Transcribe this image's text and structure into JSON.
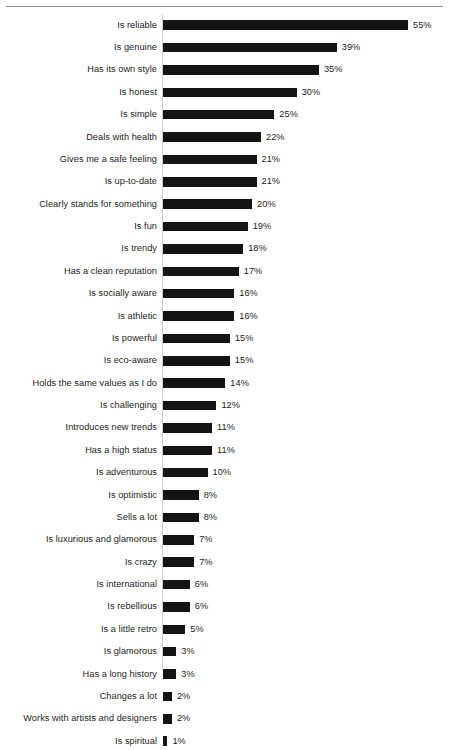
{
  "chart_data": {
    "type": "bar",
    "orientation": "horizontal",
    "title": "",
    "subtitle": "",
    "xlabel": "",
    "ylabel": "",
    "xlim": [
      0,
      55
    ],
    "grid": false,
    "legend": null,
    "value_suffix": "%",
    "categories": [
      "Is reliable",
      "Is genuine",
      "Has its own style",
      "Is honest",
      "Is simple",
      "Deals with health",
      "Gives me a safe feeling",
      "Is up-to-date",
      "Clearly stands for something",
      "Is fun",
      "Is trendy",
      "Has a clean reputation",
      "Is socially aware",
      "Is athletic",
      "Is powerful",
      "Is eco-aware",
      "Holds the same values as I do",
      "Is challenging",
      "Introduces new trends",
      "Has a high status",
      "Is adventurous",
      "Is optimistic",
      "Sells a lot",
      "Is luxurious and glamorous",
      "Is crazy",
      "Is international",
      "Is rebellious",
      "Is a little retro",
      "Is glamorous",
      "Has a long history",
      "Changes a lot",
      "Works with artists and designers",
      "Is spiritual"
    ],
    "values": [
      55,
      39,
      35,
      30,
      25,
      22,
      21,
      21,
      20,
      19,
      18,
      17,
      16,
      16,
      15,
      15,
      14,
      12,
      11,
      11,
      10,
      8,
      8,
      7,
      7,
      6,
      6,
      5,
      3,
      3,
      2,
      2,
      1
    ],
    "data_labels": [
      "55%",
      "39%",
      "35%",
      "30%",
      "25%",
      "22%",
      "21%",
      "21%",
      "20%",
      "19%",
      "18%",
      "17%",
      "16%",
      "16%",
      "15%",
      "15%",
      "14%",
      "12%",
      "11%",
      "11%",
      "10%",
      "8%",
      "8%",
      "7%",
      "7%",
      "6%",
      "6%",
      "5%",
      "3%",
      "3%",
      "2%",
      "2%",
      "1%"
    ],
    "colors": {
      "bar": "#141414",
      "text": "#1c1c1c",
      "axis": "#cfcfcf",
      "rule": "#8d8d8d",
      "background": "#ffffff"
    }
  }
}
